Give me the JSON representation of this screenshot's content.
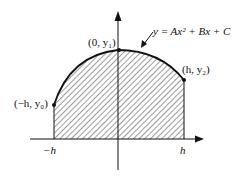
{
  "diagram": {
    "curve_equation": "y = Ax² + Bx + C",
    "points": [
      {
        "label": "(−h, y₀)"
      },
      {
        "label": "(0, y₁)"
      },
      {
        "label": "(h, y₂)"
      }
    ],
    "x_ticks": [
      "−h",
      "h"
    ],
    "colors": {
      "stroke": "#111111",
      "hatch": "#222222",
      "background": "#ffffff"
    }
  }
}
